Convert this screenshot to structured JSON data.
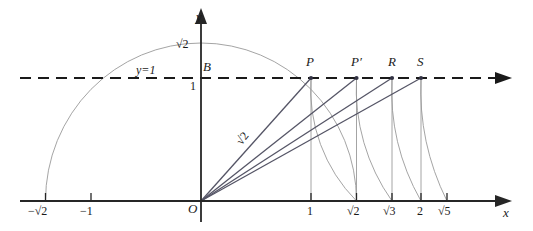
{
  "figure": {
    "type": "geometric-diagram",
    "colors": {
      "axis": "#262626",
      "ray": "#4a4a5a",
      "arc": "#8a8a8a",
      "drop_line": "#8a8a8a",
      "dashed_line": "#1a1a1a",
      "text": "#1a1a1a",
      "background": "#ffffff"
    }
  },
  "axes": {
    "x_axis_label": "x",
    "y_axis_label": "y",
    "origin_label": "O"
  },
  "guides": {
    "horizontal_line_label": "y=1",
    "horizontal_line_value": 1,
    "horizontal_line_style": "dashed"
  },
  "y_ticks": [
    {
      "label": "√2",
      "value": 1.41421
    },
    {
      "label": "1",
      "value": 1
    }
  ],
  "x_ticks": [
    {
      "label": "−√2",
      "value": -1.41421
    },
    {
      "label": "−1",
      "value": -1
    },
    {
      "label": "1",
      "value": 1
    },
    {
      "label": "√2",
      "value": 1.41421
    },
    {
      "label": "√3",
      "value": 1.73205
    },
    {
      "label": "2",
      "value": 2
    },
    {
      "label": "√5",
      "value": 2.23607
    }
  ],
  "points": [
    {
      "name": "B",
      "label": "B",
      "x": 0,
      "y": 1
    },
    {
      "name": "P",
      "label": "P",
      "x": 1,
      "y": 1
    },
    {
      "name": "P-prime",
      "label": "P′",
      "x": 1.41421,
      "y": 1
    },
    {
      "name": "R",
      "label": "R",
      "x": 1.73205,
      "y": 1
    },
    {
      "name": "S",
      "label": "S",
      "x": 2,
      "y": 1
    }
  ],
  "segment_labels": [
    {
      "name": "OP-length",
      "label": "√2"
    }
  ],
  "arcs": [
    {
      "name": "semicircle-radius-sqrt2",
      "center_x": 0,
      "center_y": 0,
      "radius": 1.41421,
      "from_x": -1.41421,
      "to_x": 1.41421
    },
    {
      "name": "arc-P-to-sqrt2",
      "center_x": 0,
      "center_y": 0,
      "from_point": "P",
      "to_x": 1.41421
    },
    {
      "name": "arc-Pprime-to-sqrt3",
      "center_x": 0,
      "center_y": 0,
      "from_point": "P′",
      "to_x": 1.73205
    },
    {
      "name": "arc-R-to-2",
      "center_x": 0,
      "center_y": 0,
      "from_point": "R",
      "to_x": 2
    },
    {
      "name": "arc-S-to-sqrt5",
      "center_x": 0,
      "center_y": 0,
      "from_point": "S",
      "to_x": 2.23607
    }
  ],
  "rays": [
    {
      "name": "ray-O-to-P",
      "to_point": "P"
    },
    {
      "name": "ray-O-to-Pprime",
      "to_point": "P′"
    },
    {
      "name": "ray-O-to-R",
      "to_point": "R"
    },
    {
      "name": "ray-O-to-S",
      "to_point": "S"
    }
  ],
  "drop_lines": [
    {
      "name": "drop-P",
      "from_point": "P",
      "to_x": 1
    },
    {
      "name": "drop-Pprime",
      "from_point": "P′",
      "to_x": 1.41421
    },
    {
      "name": "drop-R",
      "from_point": "R",
      "to_x": 1.73205
    },
    {
      "name": "drop-S",
      "from_point": "S",
      "to_x": 2
    }
  ]
}
